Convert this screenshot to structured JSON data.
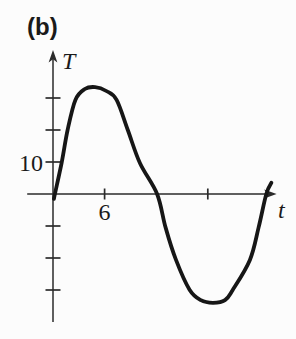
{
  "figure": {
    "panel_label": "(b)"
  },
  "colors": {
    "background": "#fcfcfc",
    "axis": "#2b2b2b",
    "curve": "#161616",
    "text": "#1a1a1a"
  },
  "chart_data": {
    "type": "line",
    "title": "",
    "xlabel": "t",
    "ylabel": "T",
    "x_ticks": [
      6,
      18
    ],
    "x_tick_labels": [
      "6",
      ""
    ],
    "y_ticks": [
      30,
      20,
      10,
      -10,
      -20,
      -30
    ],
    "y_tick_labels": [
      "",
      "",
      "10",
      "",
      "",
      ""
    ],
    "xlim": [
      -3,
      26
    ],
    "ylim": [
      -40,
      45
    ],
    "grid": false,
    "legend": null,
    "series": [
      {
        "name": "T(t)",
        "points": [
          [
            0.1,
            -1.5
          ],
          [
            1.0,
            9.7
          ],
          [
            1.7,
            20.0
          ],
          [
            2.6,
            29.4
          ],
          [
            3.7,
            32.8
          ],
          [
            4.9,
            33.4
          ],
          [
            6.2,
            32.2
          ],
          [
            7.4,
            29.4
          ],
          [
            8.7,
            20.0
          ],
          [
            10.1,
            9.7
          ],
          [
            12.1,
            0.0
          ],
          [
            13.1,
            -10.6
          ],
          [
            14.3,
            -20.6
          ],
          [
            15.9,
            -30.0
          ],
          [
            17.2,
            -33.2
          ],
          [
            18.6,
            -34.0
          ],
          [
            20.0,
            -33.2
          ],
          [
            20.9,
            -30.0
          ],
          [
            22.9,
            -20.6
          ],
          [
            23.9,
            -10.6
          ],
          [
            24.8,
            0.0
          ],
          [
            25.4,
            3.5
          ]
        ]
      }
    ]
  }
}
